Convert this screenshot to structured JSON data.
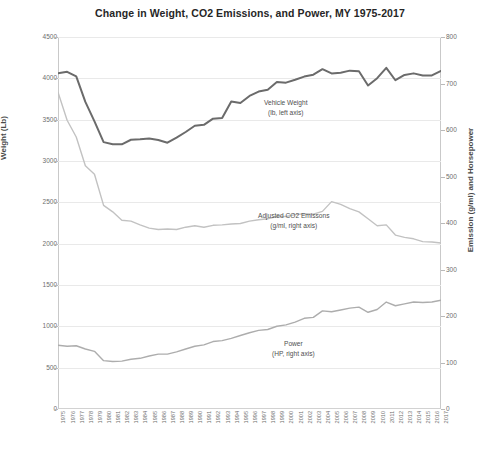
{
  "chart_data": {
    "type": "line",
    "title": "Change in Weight, CO2 Emissions, and Power, MY 1975-2017",
    "xlabel": "",
    "ylabel": "Weight (Lb)",
    "y2label": "Emission (g/ml) and Horsepower",
    "ylim": [
      0,
      4500
    ],
    "y2lim": [
      0,
      800
    ],
    "yticks": [
      0,
      500,
      1000,
      1500,
      2000,
      2500,
      3000,
      3500,
      4000,
      4500
    ],
    "y2ticks": [
      0,
      100,
      200,
      300,
      400,
      500,
      600,
      700,
      800
    ],
    "grid": true,
    "legend": "inline-annotations",
    "categories": [
      "1975",
      "1976",
      "1977",
      "1978",
      "1979",
      "1980",
      "1981",
      "1982",
      "1983",
      "1984",
      "1985",
      "1986",
      "1987",
      "1988",
      "1989",
      "1990",
      "1991",
      "1992",
      "1993",
      "1994",
      "1995",
      "1996",
      "1997",
      "1998",
      "1999",
      "2000",
      "2001",
      "2002",
      "2003",
      "2004",
      "2005",
      "2006",
      "2007",
      "2008",
      "2009",
      "2010",
      "2011",
      "2012",
      "2013",
      "2014",
      "2015",
      "2016",
      "2017"
    ],
    "series": [
      {
        "name": "Vehicle Weight",
        "units": "lb",
        "axis": "left",
        "color": "#6b6b6b",
        "annotation_line1": "Vehicle Weight",
        "annotation_line2": "(lb, left axis)",
        "values": [
          4060,
          4079,
          4024,
          3715,
          3480,
          3228,
          3202,
          3202,
          3257,
          3262,
          3271,
          3254,
          3221,
          3283,
          3351,
          3426,
          3437,
          3512,
          3519,
          3721,
          3702,
          3787,
          3840,
          3863,
          3955,
          3948,
          3983,
          4021,
          4044,
          4111,
          4059,
          4067,
          4093,
          4085,
          3914,
          4002,
          4127,
          3977,
          4041,
          4060,
          4035,
          4035,
          4089
        ]
      },
      {
        "name": "Adjusted CO2 Emissions",
        "units": "g/ml",
        "axis": "right",
        "color": "#c2c2c2",
        "annotation_line1": "Adjusted CO2 Emissons",
        "annotation_line2": "(g/ml, right axis)",
        "values": [
          681,
          621,
          585,
          523,
          505,
          438,
          424,
          406,
          404,
          396,
          389,
          386,
          387,
          386,
          391,
          394,
          391,
          395,
          396,
          398,
          399,
          404,
          407,
          409,
          414,
          414,
          418,
          420,
          419,
          425,
          446,
          440,
          431,
          424,
          409,
          394,
          396,
          374,
          369,
          366,
          360,
          359,
          357
        ]
      },
      {
        "name": "Power",
        "units": "HP",
        "axis": "right",
        "color": "#adadad",
        "annotation_line1": "Power",
        "annotation_line2": "(HP, right axis)",
        "values": [
          137,
          135,
          136,
          129,
          124,
          104,
          102,
          103,
          107,
          109,
          114,
          118,
          118,
          123,
          129,
          135,
          138,
          145,
          147,
          152,
          158,
          164,
          169,
          171,
          178,
          181,
          187,
          195,
          197,
          211,
          209,
          213,
          217,
          219,
          208,
          214,
          230,
          222,
          226,
          230,
          229,
          230,
          234
        ]
      }
    ]
  }
}
